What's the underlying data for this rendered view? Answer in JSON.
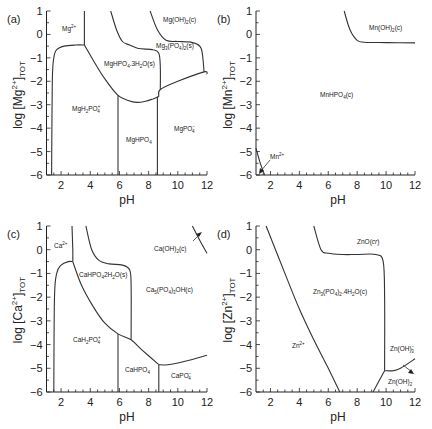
{
  "chart_data": [
    {
      "type": "line",
      "panel": "(a)",
      "title": "",
      "xlabel": "pH",
      "ylabel": "log [Mg2+]TOT",
      "xlim": [
        1,
        12
      ],
      "ylim": [
        -6,
        1
      ],
      "xticks": [
        2,
        4,
        6,
        8,
        10,
        12
      ],
      "yticks": [
        1,
        0,
        -1,
        -2,
        -3,
        -4,
        -5,
        -6
      ],
      "series": [
        {
          "name": "MgH2PO4+ boundary left",
          "x": [
            1.35,
            1.4,
            1.5,
            1.7,
            2.2,
            3,
            3.6
          ],
          "y": [
            -6,
            -2,
            -1,
            -0.65,
            -0.5,
            -0.45,
            -0.45
          ]
        },
        {
          "name": "Mg2+ / MgHPO4 boundary",
          "x": [
            3.6,
            3.6
          ],
          "y": [
            -0.45,
            1
          ]
        },
        {
          "name": "MgHPO4.3H2O lower",
          "x": [
            3.6,
            4.2,
            5,
            5.9,
            6.6,
            7.2,
            7.8,
            8.3,
            8.7
          ],
          "y": [
            -0.45,
            -1.1,
            -1.9,
            -2.6,
            -2.82,
            -2.9,
            -2.85,
            -2.75,
            -2.65
          ]
        },
        {
          "name": "MgHPO4.3H2O / Mg3(PO4)2 boundary",
          "x": [
            5.4,
            5.8,
            6.2,
            6.7,
            7.3,
            8.3,
            8.7,
            8.8,
            8.8
          ],
          "y": [
            1,
            0.2,
            -0.3,
            -0.45,
            -0.6,
            -0.65,
            -0.8,
            -1.4,
            -2.35
          ]
        },
        {
          "name": "Mg3(PO4)2 lower",
          "x": [
            8.7,
            8.8,
            10,
            11.8,
            12
          ],
          "y": [
            -2.65,
            -2.35,
            -2,
            -1.6,
            -1.7
          ]
        },
        {
          "name": "Mg(OH)2 boundary",
          "x": [
            8.1,
            8.6,
            9.2,
            10,
            11,
            11.6,
            11.8
          ],
          "y": [
            1,
            0.2,
            -0.25,
            -0.3,
            -0.35,
            -0.6,
            -1.6
          ]
        },
        {
          "name": "MgH2PO4+/MgHPO4",
          "x": [
            5.9,
            5.9
          ],
          "y": [
            -2.6,
            -6
          ]
        },
        {
          "name": "MgHPO4/MgPO4-",
          "x": [
            8.6,
            8.6
          ],
          "y": [
            -2.65,
            -6
          ]
        }
      ],
      "annotations": [
        "Mg2+",
        "Mg(OH)2(c)",
        "Mg3(PO4)2(s)",
        "MgHPO4.3H2O(s)",
        "MgH2PO4+",
        "MgHPO4",
        "MgPO4-"
      ]
    },
    {
      "type": "line",
      "panel": "(b)",
      "xlabel": "pH",
      "ylabel": "log [Mn2+]TOT",
      "xlim": [
        1,
        12
      ],
      "ylim": [
        -6,
        1
      ],
      "xticks": [
        2,
        4,
        6,
        8,
        10,
        12
      ],
      "yticks": [
        1,
        0,
        -1,
        -2,
        -3,
        -4,
        -5,
        -6
      ],
      "series": [
        {
          "name": "Mn(OH)2 boundary",
          "x": [
            7.1,
            7.5,
            8,
            8.5,
            10,
            12
          ],
          "y": [
            1,
            0.2,
            -0.25,
            -0.33,
            -0.35,
            -0.36
          ]
        },
        {
          "name": "Mn2+ boundary",
          "x": [
            1,
            1.3,
            1.6
          ],
          "y": [
            -4.85,
            -5.5,
            -6
          ]
        }
      ],
      "annotations": [
        "Mn(OH)2(c)",
        "MnHPO4(c)",
        "Mn2+"
      ]
    },
    {
      "type": "line",
      "panel": "(c)",
      "xlabel": "pH",
      "ylabel": "log [Ca2+]TOT",
      "xlim": [
        1,
        12
      ],
      "ylim": [
        -6,
        1
      ],
      "xticks": [
        2,
        4,
        6,
        8,
        10,
        12
      ],
      "yticks": [
        1,
        0,
        -1,
        -2,
        -3,
        -4,
        -5,
        -6
      ],
      "series": [
        {
          "name": "CaH2PO4+ left",
          "x": [
            1.5,
            1.55,
            1.7,
            2,
            2.5,
            2.8
          ],
          "y": [
            -6,
            -2,
            -1,
            -0.65,
            -0.5,
            -0.5
          ]
        },
        {
          "name": "Ca2+ boundary",
          "x": [
            2.75,
            2.8,
            2.8
          ],
          "y": [
            1,
            0,
            -0.5
          ]
        },
        {
          "name": "CaHPO4.2H2O lower",
          "x": [
            2.8,
            3.4,
            4.2,
            5,
            5.9,
            6.8,
            7.5,
            8.7
          ],
          "y": [
            -0.5,
            -1.5,
            -2.4,
            -3.1,
            -3.55,
            -3.8,
            -4.2,
            -4.85
          ]
        },
        {
          "name": "CaHPO4.2H2O / Ca5(PO4)3OH",
          "x": [
            3.7,
            4.1,
            4.6,
            5.3,
            6.2,
            6.7,
            6.8,
            6.8
          ],
          "y": [
            1,
            0,
            -0.45,
            -0.6,
            -0.65,
            -0.85,
            -1.5,
            -3.8
          ]
        },
        {
          "name": "Ca5(PO4)3OH lower",
          "x": [
            8.7,
            9.3,
            10.5,
            12
          ],
          "y": [
            -4.85,
            -4.85,
            -4.7,
            -4.45
          ]
        },
        {
          "name": "Ca(OH)2 boundary",
          "x": [
            11,
            11.5,
            12
          ],
          "y": [
            1,
            0.4,
            -0.15
          ]
        },
        {
          "name": "CaH2PO4+/CaHPO4",
          "x": [
            5.9,
            5.9
          ],
          "y": [
            -3.55,
            -6
          ]
        },
        {
          "name": "CaHPO4/CaPO4-",
          "x": [
            8.7,
            8.7
          ],
          "y": [
            -4.85,
            -6
          ]
        }
      ],
      "annotations": [
        "Ca2+",
        "Ca(OH)2(c)",
        "CaHPO4.2H2O(s)",
        "Ca5(PO4)3OH(c)",
        "CaH2PO4+",
        "CaHPO4",
        "CaPO4-"
      ]
    },
    {
      "type": "line",
      "panel": "(d)",
      "xlabel": "pH",
      "ylabel": "log [Zn2+]TOT",
      "xlim": [
        1,
        12
      ],
      "ylim": [
        -6,
        1
      ],
      "xticks": [
        2,
        4,
        6,
        8,
        10,
        12
      ],
      "yticks": [
        1,
        0,
        -1,
        -2,
        -3,
        -4,
        -5,
        -6
      ],
      "series": [
        {
          "name": "Zn2+ boundary",
          "x": [
            1.7,
            3,
            4,
            5,
            6,
            6.8
          ],
          "y": [
            1,
            -1,
            -2.5,
            -3.8,
            -5,
            -6
          ]
        },
        {
          "name": "ZnO / Zn3(PO4)2 boundary",
          "x": [
            5,
            5.5,
            6,
            7,
            8,
            9.3,
            9.8,
            9.9,
            9.9
          ],
          "y": [
            1,
            0,
            -0.15,
            -0.2,
            -0.2,
            -0.2,
            -0.5,
            -2,
            -5.1
          ]
        },
        {
          "name": "Zn(OH)3- boundary",
          "x": [
            9.9,
            10.5,
            11,
            12
          ],
          "y": [
            -5.1,
            -5.1,
            -5,
            -4.6
          ]
        },
        {
          "name": "Zn(OH)2 boundary",
          "x": [
            9.1,
            9.9
          ],
          "y": [
            -6,
            -5.1
          ]
        }
      ],
      "annotations": [
        "ZnO(cr)",
        "Zn3(PO4)2.4H2O(c)",
        "Zn2+",
        "Zn(OH)3-",
        "Zn(OH)2"
      ]
    }
  ],
  "panels": {
    "a": {
      "label": "(a)",
      "xlabel": "pH",
      "ylabel_main": "log [Mg",
      "ylabel_sup": "2+",
      "ylabel_end": "]",
      "ylabel_sub": "TOT",
      "regions": {
        "mg2": "Mg2+",
        "mgoh2": "Mg(OH)2(c)",
        "mg3po4": "Mg3(PO4)2(s)",
        "mghpo4_3h2o": "MgHPO4.3H2O(s)",
        "mgh2po4": "MgH2PO4+",
        "mghpo4": "MgHPO4",
        "mgpo4": "MgPO4-"
      }
    },
    "b": {
      "label": "(b)",
      "xlabel": "pH",
      "ylabel_main": "log [Mn",
      "ylabel_sup": "2+",
      "ylabel_end": "]",
      "ylabel_sub": "TOT",
      "regions": {
        "mnoh2": "Mn(OH)2(c)",
        "mnhpo4": "MnHPO4(c)",
        "mn2": "Mn2+"
      }
    },
    "c": {
      "label": "(c)",
      "xlabel": "pH",
      "ylabel_main": "log [Ca",
      "ylabel_sup": "2+",
      "ylabel_end": "]",
      "ylabel_sub": "TOT",
      "regions": {
        "ca2": "Ca2+",
        "caoh2": "Ca(OH)2(c)",
        "cahpo4_2h2o": "CaHPO4.2H2O(s)",
        "ca5po4oh": "Ca5(PO4)3OH(c)",
        "cah2po4": "CaH2PO4+",
        "cahpo4": "CaHPO4",
        "capo4": "CaPO4-"
      }
    },
    "d": {
      "label": "(d)",
      "xlabel": "pH",
      "ylabel_main": "log [Zn",
      "ylabel_sup": "2+",
      "ylabel_end": "]",
      "ylabel_sub": "TOT",
      "regions": {
        "zno": "ZnO(cr)",
        "zn3po4": "Zn3(PO4)2.4H2O(c)",
        "zn2": "Zn2+",
        "znoh3": "Zn(OH)3-",
        "znoh2": "Zn(OH)2"
      }
    }
  },
  "ticks": {
    "x": [
      "2",
      "4",
      "6",
      "8",
      "10",
      "12"
    ],
    "y": [
      "1",
      "0",
      "−1",
      "−2",
      "−3",
      "−4",
      "−5",
      "−6"
    ]
  }
}
